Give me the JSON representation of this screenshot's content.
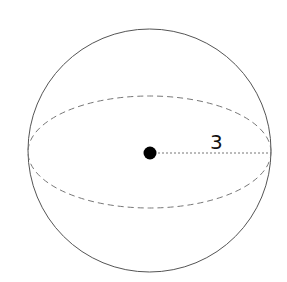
{
  "diagram": {
    "shape": "sphere",
    "radius_label": "3",
    "colors": {
      "outline": "#555555",
      "dashed": "#777777",
      "center": "#000000",
      "label": "#111111",
      "background": "#ffffff"
    },
    "elements": [
      {
        "type": "circle",
        "role": "sphere-outline"
      },
      {
        "type": "ellipse",
        "role": "equator",
        "style": "dashed"
      },
      {
        "type": "point",
        "role": "center"
      },
      {
        "type": "line",
        "role": "radius",
        "style": "dotted"
      },
      {
        "type": "text",
        "role": "radius-label",
        "value": "3"
      }
    ]
  }
}
